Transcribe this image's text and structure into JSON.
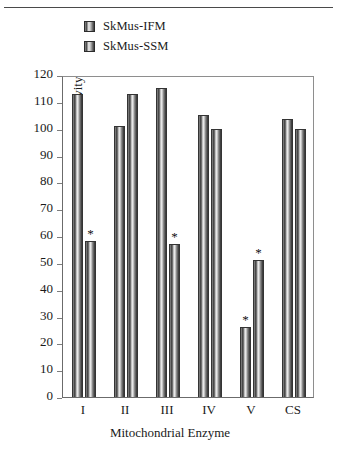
{
  "chart_data": {
    "type": "bar",
    "title": "",
    "subtitle": "",
    "xlabel": "Mitochondrial Enzyme",
    "ylabel": "% Control Activity",
    "categories": [
      "I",
      "II",
      "III",
      "IV",
      "V",
      "CS"
    ],
    "ylim": [
      0,
      120
    ],
    "yticks": [
      0,
      10,
      20,
      30,
      40,
      50,
      60,
      70,
      80,
      90,
      100,
      110,
      120
    ],
    "grid": false,
    "legend_position": "top-center",
    "series": [
      {
        "name": "SkMus-IFM",
        "values": [
          113,
          101,
          115,
          105,
          26,
          103.5
        ],
        "annotations": [
          "",
          "",
          "",
          "",
          "*",
          ""
        ]
      },
      {
        "name": "SkMus-SSM",
        "values": [
          58,
          113,
          57,
          100,
          51,
          100
        ],
        "annotations": [
          "*",
          "",
          "*",
          "",
          "*",
          ""
        ]
      }
    ],
    "annotation_symbol": "*",
    "colors": {
      "bar_outline": "#343434",
      "bar_light": "#f3f3f3",
      "bar_dark": "#303030",
      "axis": "#7d7d7d",
      "frame": "#8e8e8e",
      "text": "#1a1a1a",
      "top_rule": "#4a4a4a"
    }
  },
  "legend": {
    "items": [
      {
        "label": "SkMus-IFM"
      },
      {
        "label": "SkMus-SSM"
      }
    ]
  }
}
